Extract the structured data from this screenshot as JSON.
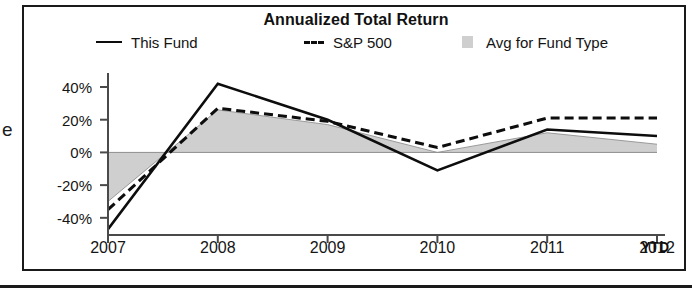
{
  "figure": {
    "edge_glyph": "e",
    "title": "Annualized Total Return"
  },
  "legend": {
    "items": [
      {
        "label": "This Fund",
        "marker": "solid-line-swatch",
        "color": "#0d0d0d"
      },
      {
        "label": "S&P 500",
        "marker": "dashed-line-swatch",
        "color": "#0d0d0d"
      },
      {
        "label": "Avg for Fund Type",
        "marker": "area-swatch",
        "color": "#cfcfcf"
      }
    ]
  },
  "axes": {
    "y_ticks": [
      "40%",
      "20%",
      "0%",
      "-20%",
      "-40%"
    ],
    "x_ticks": [
      "2007",
      "2008",
      "2009",
      "2010",
      "2011",
      "2012"
    ],
    "x_suffix": "YTD"
  },
  "chart_data": {
    "type": "line",
    "title": "Annualized Total Return",
    "xlabel": "",
    "ylabel": "",
    "categories": [
      "2007",
      "2008",
      "2009",
      "2010",
      "2011",
      "2012"
    ],
    "x_tick_labels": [
      "2007",
      "2008",
      "2009",
      "2010",
      "2011",
      "2012 YTD"
    ],
    "y_tick_labels": [
      "-40%",
      "-20%",
      "0%",
      "20%",
      "40%"
    ],
    "ylim": [
      -50,
      45
    ],
    "grid": false,
    "zero_line": true,
    "legend_position": "top",
    "units": "percent",
    "series": [
      {
        "name": "This Fund",
        "style": "solid",
        "color": "#0d0d0d",
        "values": [
          -47,
          42,
          20,
          -11,
          14,
          10
        ]
      },
      {
        "name": "S&P 500",
        "style": "dashed",
        "color": "#0d0d0d",
        "values": [
          -35,
          27,
          19,
          3,
          21,
          21
        ]
      },
      {
        "name": "Avg for Fund Type",
        "style": "area",
        "color": "#cfcfcf",
        "values": [
          -30,
          26,
          17,
          0,
          12,
          5
        ]
      }
    ]
  }
}
